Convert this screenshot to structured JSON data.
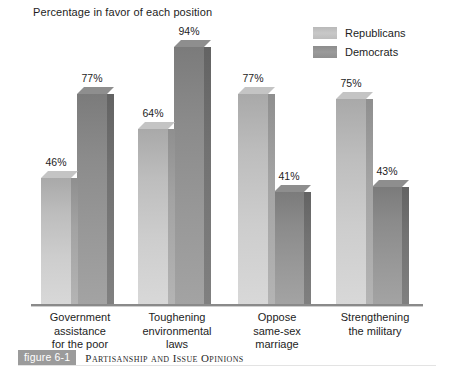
{
  "chart": {
    "title": "Percentage in favor of each position"
  },
  "legend": {
    "items": [
      {
        "label": "Republicans",
        "color": "#c4c4c4",
        "key": "rep"
      },
      {
        "label": "Democrats",
        "color": "#8e8e8e",
        "key": "dem"
      }
    ]
  },
  "caption": {
    "tag": "figure 6-1",
    "text": "Partisanship and Issue Opinions"
  },
  "chart_data": {
    "type": "bar",
    "title": "Percentage in favor of each position",
    "xlabel": "",
    "ylabel": "",
    "ylim": [
      0,
      100
    ],
    "grid": false,
    "legend_position": "top-right",
    "value_suffix": "%",
    "categories": [
      "Government assistance for the poor",
      "Toughening environmental laws",
      "Oppose same-sex marriage",
      "Strengthening the military"
    ],
    "category_lines": [
      [
        "Government",
        "assistance",
        "for the poor"
      ],
      [
        "Toughening",
        "environmental",
        "laws"
      ],
      [
        "Oppose",
        "same-sex",
        "marriage"
      ],
      [
        "Strengthening",
        "the military"
      ]
    ],
    "series": [
      {
        "name": "Republicans",
        "color": "#c4c4c4",
        "values": [
          46,
          64,
          77,
          75
        ]
      },
      {
        "name": "Democrats",
        "color": "#8e8e8e",
        "values": [
          77,
          94,
          41,
          43
        ]
      }
    ],
    "value_labels": [
      [
        "46%",
        "77%"
      ],
      [
        "64%",
        "94%"
      ],
      [
        "77%",
        "41%"
      ],
      [
        "75%",
        "43%"
      ]
    ]
  }
}
